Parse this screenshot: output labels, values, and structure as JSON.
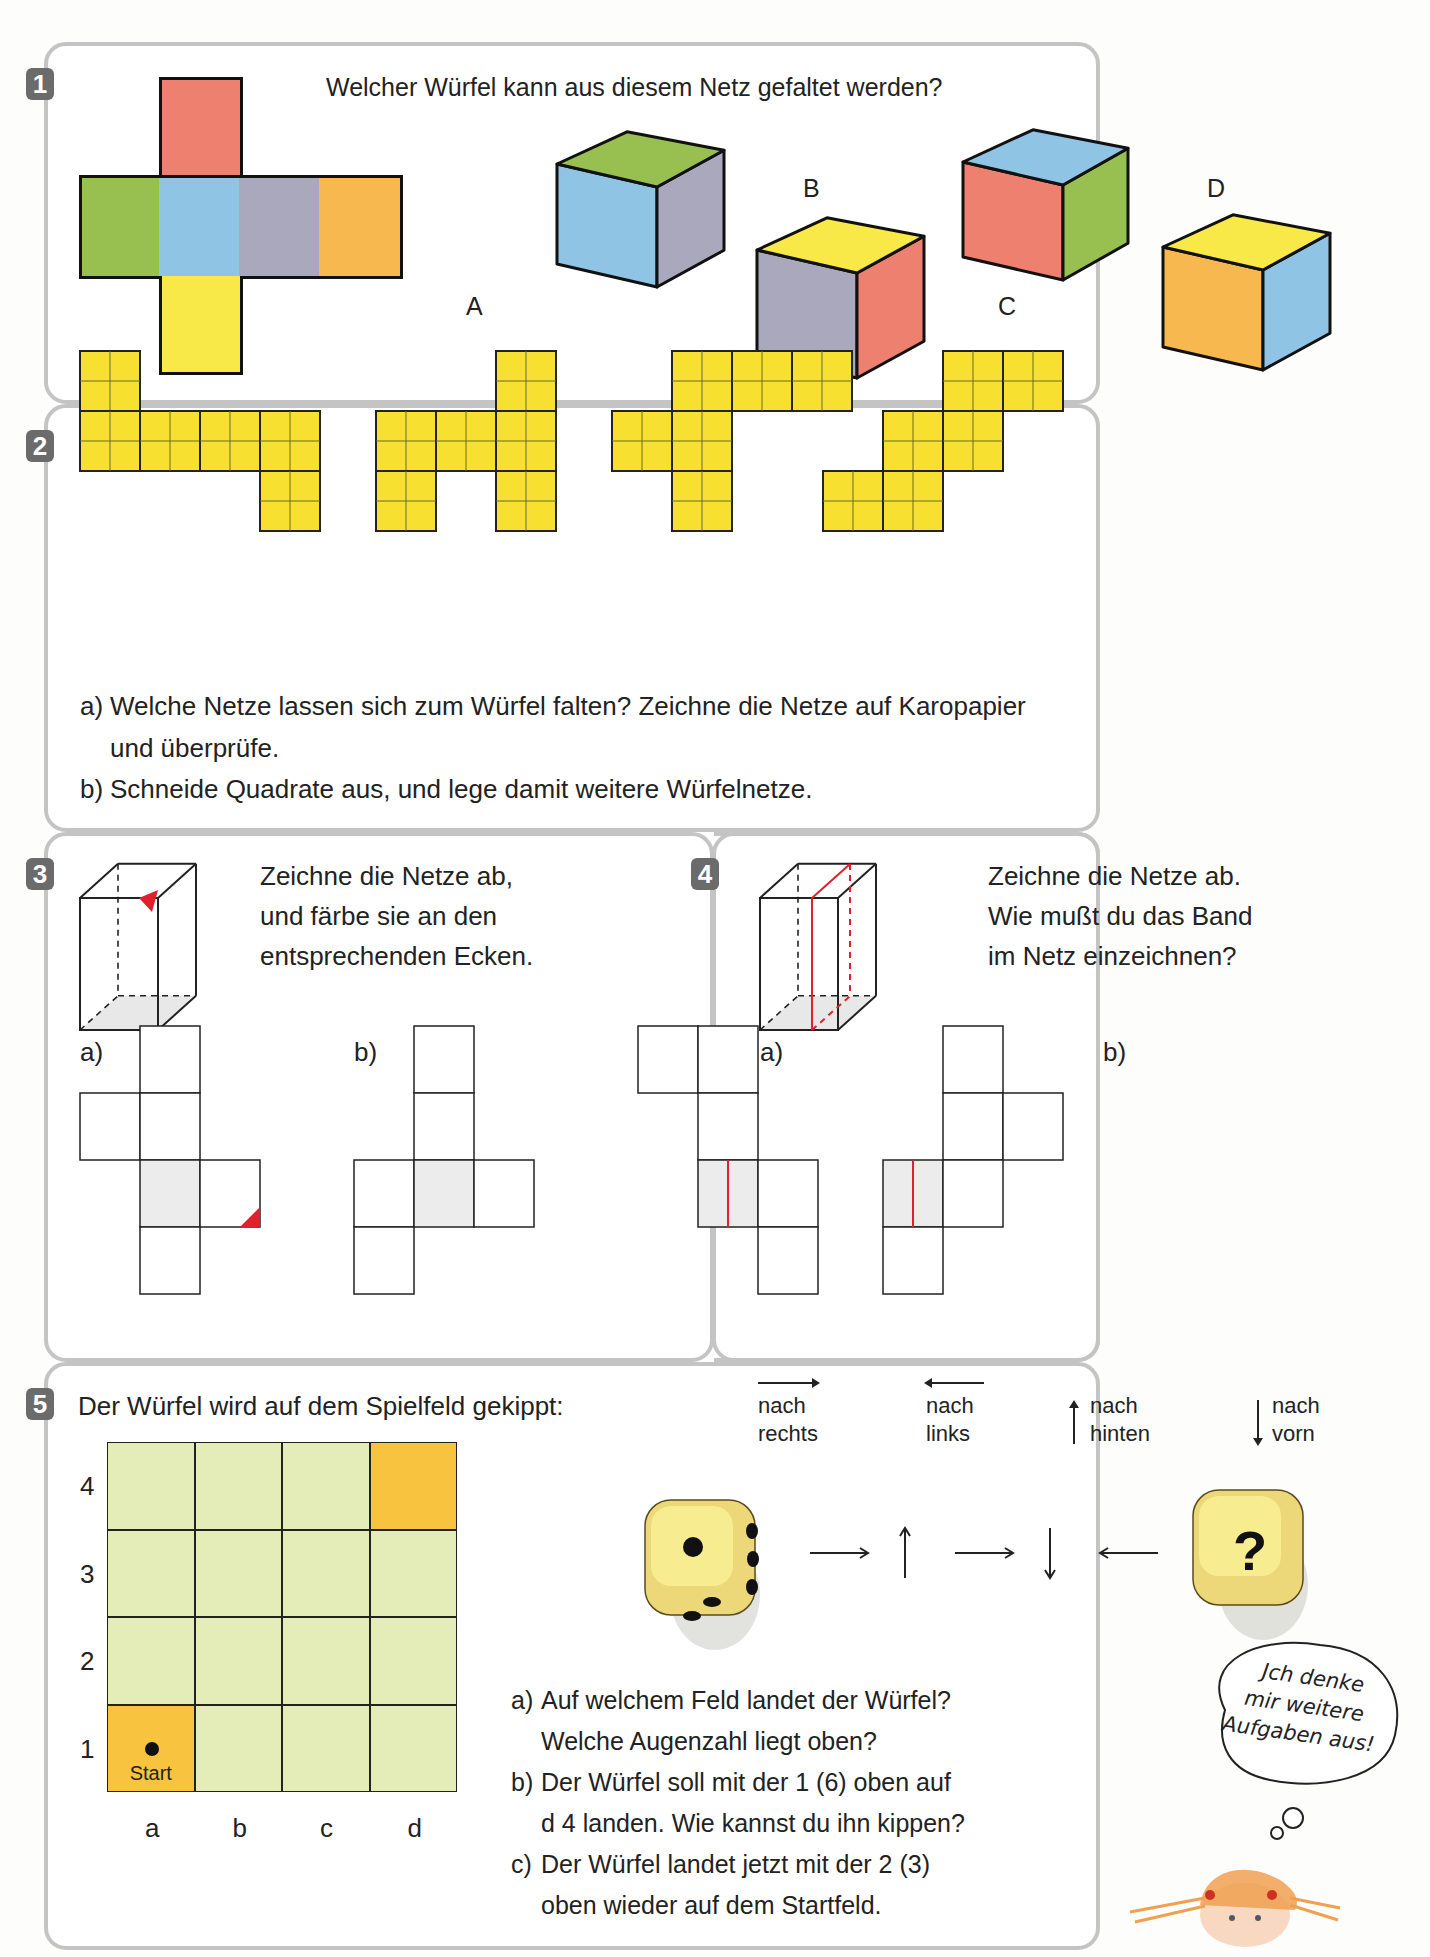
{
  "page": {
    "partial_header": "..."
  },
  "task1": {
    "number": "1",
    "question": "Welcher Würfel kann aus diesem Netz gefaltet werden?",
    "net_faces": {
      "top": "#ee8070",
      "left": "#98c050",
      "center": "#90c4e4",
      "right": "#aaa8bc",
      "far_right": "#f8b850",
      "bottom": "#f8e848"
    },
    "cubes": [
      {
        "label": "A",
        "top": "#98c050",
        "front": "#90c4e4",
        "side": "#aaa8bc"
      },
      {
        "label": "B",
        "top": "#f8e848",
        "front": "#aaa8bc",
        "side": "#ee8070"
      },
      {
        "label": "C",
        "top": "#90c4e4",
        "front": "#ee8070",
        "side": "#98c050"
      },
      {
        "label": "D",
        "top": "#f8e848",
        "front": "#f8b850",
        "side": "#90c4e4"
      }
    ]
  },
  "task2": {
    "number": "2",
    "net_color": "#f8e030",
    "nets": [
      {
        "cells": [
          [
            0,
            0
          ],
          [
            1,
            0
          ],
          [
            1,
            1
          ],
          [
            1,
            2
          ],
          [
            1,
            3
          ],
          [
            2,
            3
          ]
        ]
      },
      {
        "cells": [
          [
            0,
            2
          ],
          [
            1,
            0
          ],
          [
            1,
            1
          ],
          [
            1,
            2
          ],
          [
            2,
            0
          ],
          [
            2,
            2
          ]
        ]
      },
      {
        "cells": [
          [
            0,
            1
          ],
          [
            0,
            2
          ],
          [
            0,
            3
          ],
          [
            1,
            0
          ],
          [
            1,
            1
          ],
          [
            2,
            1
          ]
        ]
      },
      {
        "cells": [
          [
            0,
            2
          ],
          [
            0,
            3
          ],
          [
            1,
            1
          ],
          [
            1,
            2
          ],
          [
            2,
            0
          ],
          [
            2,
            1
          ]
        ]
      }
    ],
    "items": [
      {
        "label": "a)",
        "line1": "Welche Netze lassen sich zum Würfel falten? Zeichne die Netze auf Karopapier",
        "line2": "und überprüfe."
      },
      {
        "label": "b)",
        "line1": "Schneide Quadrate aus, und lege damit weitere Würfelnetze."
      }
    ]
  },
  "task3": {
    "number": "3",
    "instruction_lines": [
      "Zeichne die Netze ab,",
      "und färbe sie an den",
      "entsprechenden Ecken."
    ],
    "sub_a": "a)",
    "sub_b": "b)",
    "accent": "#e0202c"
  },
  "task4": {
    "number": "4",
    "instruction_lines": [
      "Zeichne die Netze ab.",
      "Wie mußt du das Band",
      "im Netz einzeichnen?"
    ],
    "sub_a": "a)",
    "sub_b": "b)",
    "accent": "#e0202c"
  },
  "task5": {
    "number": "5",
    "intro": "Der Würfel wird auf dem Spielfeld gekippt:",
    "legend": [
      {
        "arrow": "→",
        "line1": "nach",
        "line2": "rechts"
      },
      {
        "arrow": "←",
        "line1": "nach",
        "line2": "links"
      },
      {
        "arrow": "↑",
        "line1": "nach",
        "line2": "hinten"
      },
      {
        "arrow": "↓",
        "line1": "nach",
        "line2": "vorn"
      }
    ],
    "sequence": [
      "→",
      "↑",
      "→",
      "↓",
      "←"
    ],
    "result_die_symbol": "?",
    "board": {
      "rows": [
        "4",
        "3",
        "2",
        "1"
      ],
      "cols": [
        "a",
        "b",
        "c",
        "d"
      ],
      "field_color": "#e4edb8",
      "highlight_color": "#f8c440",
      "start_label": "Start"
    },
    "questions": [
      {
        "label": "a)",
        "line1": "Auf welchem Feld landet der Würfel?",
        "line2": "Welche Augenzahl liegt oben?"
      },
      {
        "label": "b)",
        "line1": "Der Würfel soll mit der 1 (6) oben auf",
        "line2": "d 4 landen. Wie kannst du ihn kippen?"
      },
      {
        "label": "c)",
        "line1": "Der Würfel landet jetzt mit der 2 (3)",
        "line2": "oben wieder auf dem Startfeld."
      }
    ],
    "thought_bubble": [
      "Jch denke",
      "mir weitere",
      "Aufgaben aus!"
    ]
  }
}
